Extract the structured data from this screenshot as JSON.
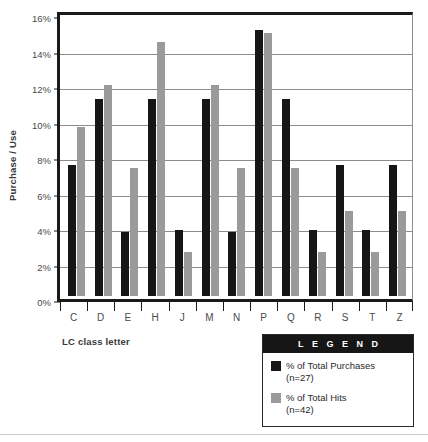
{
  "chart_data": {
    "type": "bar",
    "title": "",
    "xlabel": "LC class letter",
    "ylabel": "Purchase / Use",
    "categories": [
      "C",
      "D",
      "E",
      "H",
      "J",
      "M",
      "N",
      "P",
      "Q",
      "R",
      "S",
      "T",
      "Z"
    ],
    "series": [
      {
        "name": "% of Total Purchases",
        "sublabel": "(n=27)",
        "color": "#161616",
        "values": [
          7.4,
          11.1,
          3.6,
          11.1,
          3.7,
          11.1,
          3.6,
          15.0,
          11.1,
          3.7,
          7.4,
          3.7,
          7.4
        ]
      },
      {
        "name": "% of Total Hits",
        "sublabel": "(n=42)",
        "color": "#9a9a9a",
        "values": [
          9.5,
          11.9,
          7.2,
          14.3,
          2.5,
          11.9,
          7.2,
          14.8,
          7.2,
          2.5,
          4.8,
          2.5,
          4.8
        ]
      }
    ],
    "ylim": [
      0,
      16
    ],
    "ytick_values": [
      0,
      2,
      4,
      6,
      8,
      10,
      12,
      14,
      16
    ],
    "ytick_labels": [
      "0%",
      "2%",
      "4%",
      "6%",
      "8%",
      "10%",
      "12%",
      "14%",
      "16%"
    ],
    "grid": true,
    "legend_position": "bottom-right"
  },
  "legend": {
    "title": "L E G E N D",
    "entries": [
      {
        "label": "% of Total Purchases",
        "sublabel": "(n=27)"
      },
      {
        "label": "% of Total Hits",
        "sublabel": "(n=42)"
      }
    ]
  },
  "axes": {
    "y_title": "Purchase / Use",
    "x_title": "LC class letter"
  }
}
